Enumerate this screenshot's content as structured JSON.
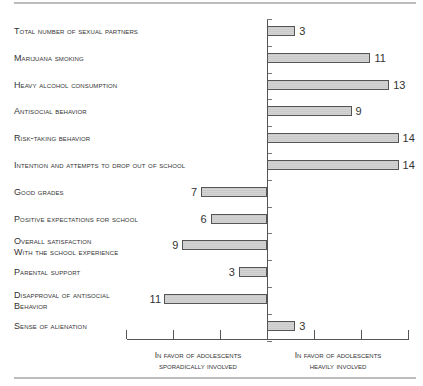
{
  "chart_data": {
    "type": "bar",
    "orientation": "horizontal-diverging",
    "title": "",
    "xlabel": "",
    "ylabel": "",
    "categories": [
      "Total number of sexual partners",
      "Marijuana smoking",
      "Heavy alcohol consumption",
      "Antisocial behavior",
      "Risk-taking behavior",
      "Intention and attempts to drop out of school",
      "Good grades",
      "Positive expectations for school",
      "Overall satisfaction with the school experience",
      "Parental support",
      "Disapproval of antisocial behavior",
      "Sense of alienation"
    ],
    "values": [
      3,
      11,
      13,
      9,
      14,
      14,
      -7,
      -6,
      -9,
      -3,
      -11,
      3
    ],
    "value_labels": [
      "3",
      "11",
      "13",
      "9",
      "14",
      "14",
      "7",
      "6",
      "9",
      "3",
      "11",
      "3"
    ],
    "xlim": [
      -15,
      15
    ],
    "x_tick_step": 5,
    "axis_captions": {
      "left": "In favor of adolescents sporadically involved",
      "right": "In favor of adolescents heavily involved"
    },
    "grid": false,
    "bar_color": "#d0d0d0",
    "bar_border": "#555555"
  },
  "labels": [
    {
      "line1": "Total number of sexual partners",
      "line2": ""
    },
    {
      "line1": "Marijuana smoking",
      "line2": ""
    },
    {
      "line1": "Heavy alcohol consumption",
      "line2": ""
    },
    {
      "line1": "Antisocial behavior",
      "line2": ""
    },
    {
      "line1": "Risk-taking behavior",
      "line2": ""
    },
    {
      "line1": "Intention and attempts to drop out of school",
      "line2": ""
    },
    {
      "line1": "Good grades",
      "line2": ""
    },
    {
      "line1": "Positive expectations for school",
      "line2": ""
    },
    {
      "line1": "Overall satisfaction",
      "line2": "with the school experience"
    },
    {
      "line1": "Parental support",
      "line2": ""
    },
    {
      "line1": "Disapproval of antisocial",
      "line2": "behavior"
    },
    {
      "line1": "Sense of alienation",
      "line2": ""
    }
  ],
  "captions": {
    "left_line1": "In favor of adolescents",
    "left_line2": "sporadically involved",
    "right_line1": "In favor of adolescents",
    "right_line2": "heavily involved"
  }
}
